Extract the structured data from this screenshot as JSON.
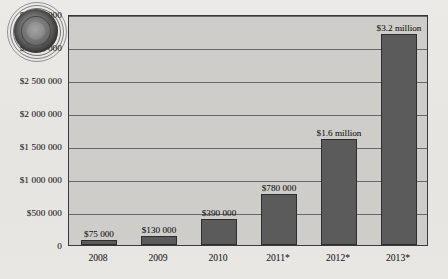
{
  "chart_data": {
    "type": "bar",
    "title": "",
    "subtitle": "",
    "xlabel": "",
    "ylabel": "",
    "categories": [
      "2008",
      "2009",
      "2010",
      "2011*",
      "2012*",
      "2013*"
    ],
    "values": [
      75000,
      130000,
      390000,
      780000,
      1600000,
      3200000
    ],
    "data_labels": [
      "$75 000",
      "$130 000",
      "$390 000",
      "$780 000",
      "$1.6 million",
      "$3.2 million"
    ],
    "ylim": [
      0,
      3500000
    ],
    "ytick_values": [
      0,
      500000,
      1000000,
      1500000,
      2000000,
      2500000,
      3000000,
      3500000
    ],
    "ytick_labels": [
      "0",
      "$500 000",
      "$1 000 000",
      "$1 500 000",
      "$2 000 000",
      "$2 500 000",
      "$3 000 000",
      "$3 500 000"
    ],
    "grid": true,
    "legend": "none",
    "colors": {
      "bar_fill": "#5b5b5b",
      "bar_border": "#2e2e2e",
      "plot_background": "#cecdc9",
      "page_background": "#e8e7e4",
      "gridline": "#56565a",
      "axis": "#3a3a3a",
      "text": "#1d1d1d"
    }
  },
  "watermark": {
    "name": "circular-seal-watermark",
    "label": ""
  }
}
